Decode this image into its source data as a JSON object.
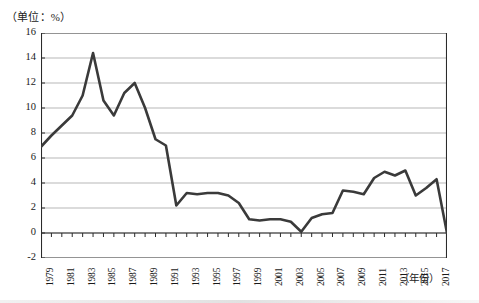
{
  "figure": {
    "unit_label": "（单位：%）",
    "x_axis_caption": "（年份）"
  },
  "chart_data": {
    "type": "line",
    "title": "",
    "subtitle": "",
    "xlabel": "（年份）",
    "ylabel": "（单位：%）",
    "grid": true,
    "legend": null,
    "xlim": [
      1979,
      2018
    ],
    "ylim": [
      -2,
      16
    ],
    "ytick_labels": [
      "16",
      "14",
      "12",
      "10",
      "8",
      "6",
      "4",
      "2",
      "0",
      "-2"
    ],
    "yticks": [
      16,
      14,
      12,
      10,
      8,
      6,
      4,
      2,
      0,
      -2
    ],
    "xtick_labels": [
      "1979",
      "1981",
      "1983",
      "1985",
      "1987",
      "1989",
      "1991",
      "1993",
      "1995",
      "1997",
      "1999",
      "2001",
      "2003",
      "2005",
      "2007",
      "2009",
      "2011",
      "2013",
      "2015",
      "2017"
    ],
    "xticks_labeled": [
      1979,
      1981,
      1983,
      1985,
      1987,
      1989,
      1991,
      1993,
      1995,
      1997,
      1999,
      2001,
      2003,
      2005,
      2007,
      2009,
      2011,
      2013,
      2015,
      2017
    ],
    "x": [
      1979,
      1980,
      1981,
      1982,
      1983,
      1984,
      1985,
      1986,
      1987,
      1988,
      1989,
      1990,
      1991,
      1992,
      1993,
      1994,
      1995,
      1996,
      1997,
      1998,
      1999,
      2000,
      2001,
      2002,
      2003,
      2004,
      2005,
      2006,
      2007,
      2008,
      2009,
      2010,
      2011,
      2012,
      2013,
      2014,
      2015,
      2016,
      2017,
      2018
    ],
    "series": [
      {
        "name": "增长率",
        "values": [
          6.9,
          7.8,
          8.6,
          9.4,
          11.0,
          14.4,
          10.6,
          9.4,
          11.2,
          12.0,
          10.0,
          7.5,
          7.0,
          2.2,
          3.2,
          3.1,
          3.2,
          3.2,
          3.0,
          2.4,
          1.1,
          1.0,
          1.1,
          1.1,
          0.9,
          0.1,
          1.2,
          1.5,
          1.6,
          3.4,
          3.3,
          3.1,
          4.4,
          4.9,
          4.6,
          5.0,
          3.0,
          3.6,
          4.3,
          0.0
        ]
      }
    ]
  }
}
